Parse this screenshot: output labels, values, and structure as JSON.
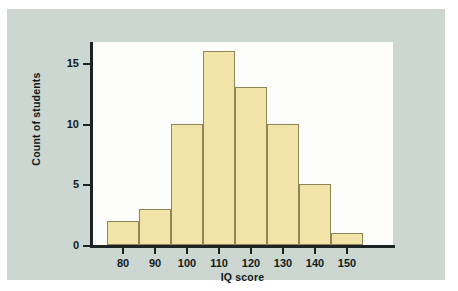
{
  "chart_data": {
    "type": "bar",
    "title": "",
    "subtitle": "",
    "xlabel": "IQ score",
    "ylabel": "Count of students",
    "categories": [
      "80",
      "90",
      "100",
      "110",
      "120",
      "130",
      "140",
      "150"
    ],
    "values": [
      2,
      3,
      10,
      16,
      13,
      10,
      5,
      1
    ],
    "bin_width": 10,
    "bin_edges": [
      75,
      85,
      95,
      105,
      115,
      125,
      135,
      145,
      155
    ],
    "xlim": [
      72,
      160
    ],
    "ylim": [
      0,
      17
    ],
    "xticks": [
      "80",
      "90",
      "100",
      "110",
      "120",
      "130",
      "140",
      "150"
    ],
    "yticks": [
      "0",
      "5",
      "10",
      "15"
    ],
    "ytick_values": [
      0,
      5,
      10,
      15
    ],
    "grid": false,
    "legend": false,
    "legend_position": "none",
    "annotations": []
  },
  "style": {
    "bar_fill": "#f2e3a8",
    "bar_stroke": "#8c8555",
    "panel_background": "#ccd7d2",
    "plot_background": "#fdfdfb",
    "axis_color": "#1b2422",
    "text_color": "#13191a"
  }
}
